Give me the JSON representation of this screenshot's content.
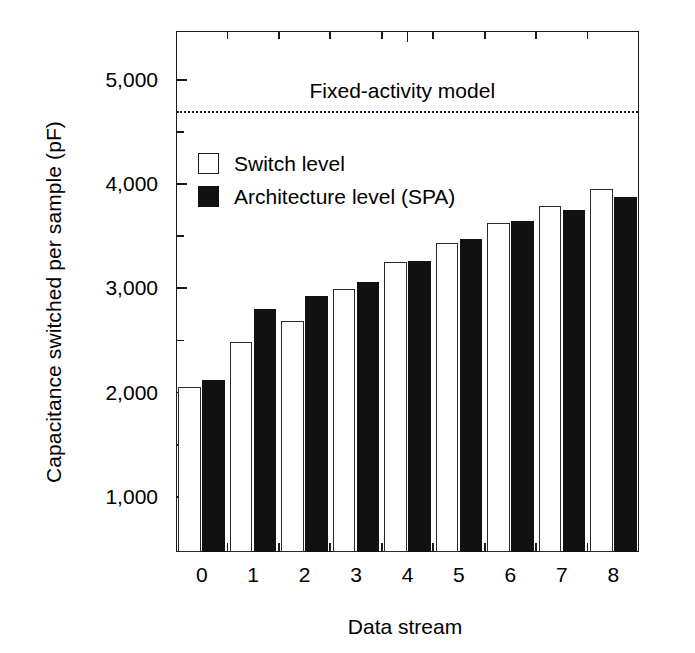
{
  "chart_data": {
    "type": "bar",
    "title": "",
    "xlabel": "Data stream",
    "ylabel": "Capacitance switched per sample (pF)",
    "categories": [
      "0",
      "1",
      "2",
      "3",
      "4",
      "5",
      "6",
      "7",
      "8"
    ],
    "series": [
      {
        "name": "Switch level",
        "style": "open-white-bar",
        "values": [
          2050,
          2490,
          2690,
          2990,
          3250,
          3440,
          3630,
          3790,
          3950
        ]
      },
      {
        "name": "Architecture level (SPA)",
        "style": "filled-black-bar",
        "values": [
          2120,
          2800,
          2930,
          3060,
          3260,
          3470,
          3650,
          3750,
          3880
        ]
      }
    ],
    "ylim": [
      470,
      5470
    ],
    "ytick_values": [
      1000,
      2000,
      3000,
      4000,
      5000
    ],
    "ytick_labels": [
      "1,000",
      "2,000",
      "3,000",
      "4,000",
      "5,000"
    ],
    "yminor_tick_values": [
      1500,
      2500,
      3500,
      4500
    ],
    "grid": false,
    "legend_position": "upper-left-inside",
    "annotations": [
      {
        "type": "horizontal-reference-line",
        "label": "Fixed-activity model",
        "value": 4700,
        "line_style": "dotted"
      }
    ]
  },
  "axes": {
    "y_title": "Capacitance switched per sample (pF)",
    "x_title": "Data stream",
    "y_ticks": [
      "5,000",
      "4,000",
      "3,000",
      "2,000",
      "1,000"
    ],
    "x_ticks": [
      "0",
      "1",
      "2",
      "3",
      "4",
      "5",
      "6",
      "7",
      "8"
    ]
  },
  "legend": {
    "items": [
      {
        "label": "Switch level",
        "swatch": "open-square"
      },
      {
        "label": "Architecture level (SPA)",
        "swatch": "filled-square"
      }
    ]
  },
  "annotation": {
    "fixed_activity_label": "Fixed-activity model"
  },
  "colors": {
    "line": "#1a1a1a",
    "fill_dark": "#111111",
    "fill_light": "#ffffff",
    "background": "#ffffff"
  }
}
